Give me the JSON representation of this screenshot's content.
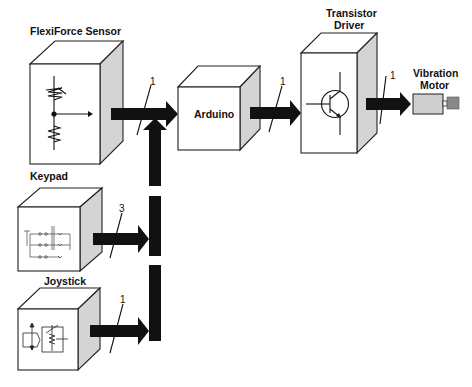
{
  "diagram": {
    "title": "",
    "blocks": {
      "flexiforce": {
        "label": "FlexiForce Sensor",
        "icon": "voltage-divider-schematic"
      },
      "keypad": {
        "label": "Keypad",
        "icon": "switch-matrix-schematic"
      },
      "joystick": {
        "label": "Joystick",
        "icon": "joystick-potentiometer-schematic"
      },
      "arduino": {
        "label": "Arduino"
      },
      "transistor": {
        "label_line1": "Transistor",
        "label_line2": "Driver",
        "icon": "npn-transistor-symbol"
      },
      "motor": {
        "label_line1": "Vibration",
        "label_line2": "Motor"
      }
    },
    "connections": [
      {
        "from": "FlexiForce Sensor",
        "to": "Arduino",
        "width": "1"
      },
      {
        "from": "Keypad",
        "to": "Arduino",
        "width": "3"
      },
      {
        "from": "Joystick",
        "to": "Arduino",
        "width": "1"
      },
      {
        "from": "Arduino",
        "to": "Transistor Driver",
        "width": "1"
      },
      {
        "from": "Transistor Driver",
        "to": "Vibration Motor",
        "width": "1"
      }
    ],
    "colors": {
      "arrow": "#111111",
      "cube_side": "#d4d4d4",
      "motor_body": "#cfcfcf",
      "motor_shaft": "#888888"
    }
  }
}
